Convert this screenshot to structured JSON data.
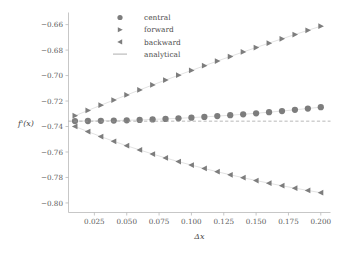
{
  "chart_data": {
    "type": "line",
    "title": "",
    "xlabel": "Δx",
    "ylabel": "f'(x)",
    "xlim": [
      0.005,
      0.2075
    ],
    "ylim": [
      -0.8075,
      -0.6505
    ],
    "grid": false,
    "legend_position": "top-center",
    "xticks": [
      0.025,
      0.05,
      0.075,
      0.1,
      0.125,
      0.15,
      0.175,
      0.2
    ],
    "xtick_labels": [
      "0.025",
      "0.050",
      "0.075",
      "0.100",
      "0.125",
      "0.150",
      "0.175",
      "0.200"
    ],
    "yticks": [
      -0.66,
      -0.68,
      -0.7,
      -0.72,
      -0.74,
      -0.76,
      -0.78,
      -0.8
    ],
    "ytick_labels": [
      "-0.66",
      "-0.68",
      "-0.70",
      "-0.72",
      "-0.74",
      "-0.76",
      "-0.78",
      "-0.80"
    ],
    "x": [
      0.01,
      0.02,
      0.03,
      0.04,
      0.05,
      0.06,
      0.07,
      0.08,
      0.09,
      0.1,
      0.11,
      0.12,
      0.13,
      0.14,
      0.15,
      0.16,
      0.17,
      0.18,
      0.19,
      0.2
    ],
    "analytical_value": -0.7358,
    "series": [
      {
        "name": "central",
        "marker": "circle",
        "color": "#7d7d7d",
        "values": [
          -0.73575,
          -0.73567,
          -0.73553,
          -0.73534,
          -0.73509,
          -0.73479,
          -0.73443,
          -0.73402,
          -0.73355,
          -0.73303,
          -0.73245,
          -0.73182,
          -0.73113,
          -0.73039,
          -0.7296,
          -0.72875,
          -0.72785,
          -0.72689,
          -0.72588,
          -0.72482
        ]
      },
      {
        "name": "forward",
        "marker": "triangle-right",
        "color": "#7d7d7d",
        "values": [
          -0.73155,
          -0.7274,
          -0.7233,
          -0.71925,
          -0.71525,
          -0.7113,
          -0.7074,
          -0.70355,
          -0.69975,
          -0.696,
          -0.6923,
          -0.68865,
          -0.68505,
          -0.6815,
          -0.678,
          -0.67455,
          -0.67115,
          -0.6678,
          -0.6645,
          -0.66125
        ]
      },
      {
        "name": "backward",
        "marker": "triangle-left",
        "color": "#7d7d7d",
        "values": [
          -0.73995,
          -0.744,
          -0.7479,
          -0.7516,
          -0.7551,
          -0.7584,
          -0.7616,
          -0.76465,
          -0.76755,
          -0.7703,
          -0.77295,
          -0.7755,
          -0.7779,
          -0.7802,
          -0.7824,
          -0.7845,
          -0.7865,
          -0.7884,
          -0.7902,
          -0.79195
        ]
      },
      {
        "name": "analytical",
        "marker": "line",
        "color": "#9a9a9a",
        "values": [
          -0.7358,
          -0.7358,
          -0.7358,
          -0.7358,
          -0.7358,
          -0.7358,
          -0.7358,
          -0.7358,
          -0.7358,
          -0.7358,
          -0.7358,
          -0.7358,
          -0.7358,
          -0.7358,
          -0.7358,
          -0.7358,
          -0.7358,
          -0.7358,
          -0.7358,
          -0.7358
        ]
      }
    ]
  },
  "legend": {
    "entries": [
      {
        "label": "central",
        "marker": "circle"
      },
      {
        "label": "forward",
        "marker": "triangle-right"
      },
      {
        "label": "backward",
        "marker": "triangle-left"
      },
      {
        "label": "analytical",
        "marker": "line"
      }
    ]
  },
  "axes": {
    "x_title": "Δx",
    "y_title": "f'(x)"
  },
  "colors": {
    "marker": "#7d7d7d",
    "connector": "#c9c9c9",
    "analytical": "#9a9a9a",
    "spine": "#b9b9b9",
    "text": "#4a4a4a",
    "background": "#ffffff"
  }
}
